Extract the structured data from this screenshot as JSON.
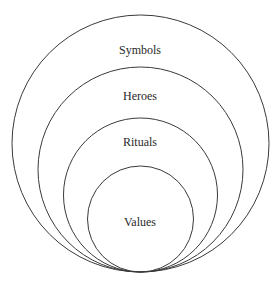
{
  "diagram": {
    "type": "nested-tangent-circles",
    "stroke_color": "#3a3a3a",
    "text_color": "#2a2a2a",
    "layers": [
      {
        "label": "Symbols",
        "cx": 140.5,
        "cy": 143.5,
        "r": 128.5,
        "label_y": 50
      },
      {
        "label": "Heroes",
        "cx": 140.5,
        "cy": 169.5,
        "r": 102.5,
        "label_y": 96
      },
      {
        "label": "Rituals",
        "cx": 140.5,
        "cy": 195,
        "r": 77,
        "label_y": 142
      },
      {
        "label": "Values",
        "cx": 140.5,
        "cy": 219,
        "r": 53,
        "label_y": 222
      }
    ]
  }
}
